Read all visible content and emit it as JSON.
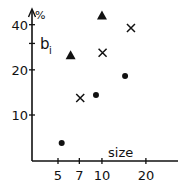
{
  "chart_data": {
    "type": "scatter",
    "title": "",
    "xlabel": "size",
    "ylabel": "%",
    "annotation": "b",
    "annotation_sub": "i",
    "xscale": "log",
    "yscale": "log",
    "xlim": [
      4.4,
      27
    ],
    "ylim": [
      4.9,
      50
    ],
    "xticks": [
      5,
      7,
      10,
      20
    ],
    "xtick_labels": [
      "5",
      "7",
      "10",
      "20"
    ],
    "yticks": [
      10,
      20,
      30,
      40
    ],
    "ytick_labels": [
      "10",
      "20",
      "",
      "40"
    ],
    "grid": false,
    "legend": null,
    "series": [
      {
        "name": "triangles",
        "marker": "triangle",
        "points": [
          [
            6.1,
            25
          ],
          [
            10.0,
            46
          ]
        ]
      },
      {
        "name": "crosses",
        "marker": "cross",
        "points": [
          [
            7.1,
            13
          ],
          [
            10.1,
            26
          ],
          [
            15.8,
            38
          ]
        ]
      },
      {
        "name": "dots",
        "marker": "dot",
        "points": [
          [
            5.3,
            6.5
          ],
          [
            9.1,
            13.6
          ],
          [
            14.4,
            18.2
          ]
        ]
      }
    ],
    "color": "#111111"
  }
}
